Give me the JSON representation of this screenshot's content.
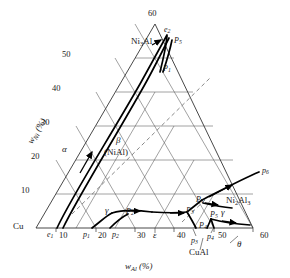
{
  "figure": {
    "type": "ternary-phase-diagram",
    "system": "Cu-Al-Ni",
    "background": "#ffffff",
    "line_color": "#444444",
    "bold_line_color": "#000000"
  },
  "axes": {
    "bottom": {
      "title_main": "w",
      "title_sub": "Al",
      "title_unit": " (%)",
      "corner_left": "Cu",
      "ticks": [
        "10",
        "20",
        "30",
        "40",
        "50",
        "60"
      ]
    },
    "left": {
      "title_main": "w",
      "title_sub": "Ni",
      "title_unit": " (%)",
      "ticks": [
        "10",
        "20",
        "30",
        "40",
        "50",
        "60"
      ]
    },
    "apex": "60"
  },
  "phase_labels": [
    {
      "name": "alpha",
      "text": "α",
      "x": 62,
      "y": 149
    },
    {
      "name": "beta",
      "text": "β",
      "x": 115,
      "y": 141
    },
    {
      "name": "beta-nial",
      "text": "(NiAl)",
      "x": 103,
      "y": 152
    },
    {
      "name": "gamma-left",
      "text": "γ",
      "x": 106,
      "y": 211
    },
    {
      "name": "gamma-right",
      "text": "γ",
      "x": 222,
      "y": 212
    },
    {
      "name": "epsilon",
      "text": "ε",
      "x": 155,
      "y": 236
    },
    {
      "name": "theta",
      "text": "θ",
      "x": 240,
      "y": 243
    }
  ],
  "compound_labels": [
    {
      "name": "ni3al",
      "main": "Ni",
      "sub1": "3",
      "tail": "Al",
      "x": 139,
      "y": 42
    },
    {
      "name": "ni2al3",
      "main": "Ni",
      "sub1": "2",
      "tail": "Al",
      "sub2": "3",
      "x": 232,
      "y": 201
    },
    {
      "name": "cual",
      "main": "CuAl",
      "x": 196,
      "y": 253
    }
  ],
  "invariant_points": [
    {
      "name": "e2",
      "letter": "e",
      "sub": "2",
      "x": 167,
      "y": 31
    },
    {
      "name": "P5-upper",
      "letter": "P",
      "sub": "5",
      "x": 176,
      "y": 42
    },
    {
      "name": "P1-upper",
      "letter": "P",
      "sub": "1",
      "x": 164,
      "y": 70
    },
    {
      "name": "p6",
      "letter": "p",
      "sub": "6",
      "x": 266,
      "y": 172
    },
    {
      "name": "PT",
      "letter": "P",
      "sub": "T",
      "x": 200,
      "y": 201
    },
    {
      "name": "P3-mid",
      "letter": "P",
      "sub": "3",
      "x": 190,
      "y": 212
    },
    {
      "name": "P5-low",
      "letter": "P",
      "sub": "5",
      "x": 213,
      "y": 215
    },
    {
      "name": "P2-mid",
      "letter": "P",
      "sub": "2",
      "x": 128,
      "y": 213
    },
    {
      "name": "P4-mid",
      "letter": "P",
      "sub": "4",
      "x": 205,
      "y": 228
    },
    {
      "name": "e1",
      "letter": "e",
      "sub": "1",
      "x": 52,
      "y": 234
    },
    {
      "name": "p1-axis",
      "letter": "p",
      "sub": "1",
      "x": 86,
      "y": 234
    },
    {
      "name": "p2-axis",
      "letter": "p",
      "sub": "2",
      "x": 114,
      "y": 234
    },
    {
      "name": "p3-axis",
      "letter": "p",
      "sub": "3",
      "x": 196,
      "y": 238
    },
    {
      "name": "p4-axis",
      "letter": "p",
      "sub": "4",
      "x": 211,
      "y": 235
    }
  ],
  "bottom_tick_labels": [
    {
      "value": "10",
      "x": 62,
      "y": 233
    },
    {
      "value": "20",
      "x": 101,
      "y": 233
    },
    {
      "value": "30",
      "x": 140,
      "y": 233
    },
    {
      "value": "40",
      "x": 180,
      "y": 233
    },
    {
      "value": "50",
      "x": 221,
      "y": 233
    },
    {
      "value": "60",
      "x": 263,
      "y": 233
    }
  ],
  "left_tick_labels": [
    {
      "value": "10",
      "x": 23,
      "y": 190
    },
    {
      "value": "20",
      "x": 33,
      "y": 156
    },
    {
      "value": "30",
      "x": 43,
      "y": 122
    },
    {
      "value": "40",
      "x": 54,
      "y": 88
    },
    {
      "value": "50",
      "x": 64,
      "y": 54
    },
    {
      "value": "60",
      "x": 150,
      "y": 10
    }
  ]
}
